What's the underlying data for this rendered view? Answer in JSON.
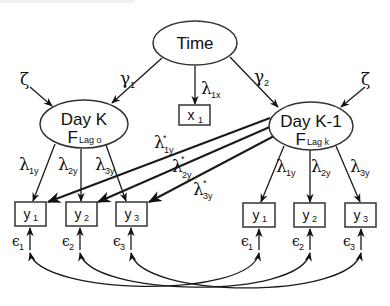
{
  "diagram": {
    "title": "",
    "latent": {
      "time": {
        "label": "Time"
      },
      "day_k": {
        "label": "Day K",
        "sub_main": "F",
        "sub_small": "Lag o"
      },
      "day_k1": {
        "label": "Day K-1",
        "sub_main": "F",
        "sub_small": "Lag k"
      }
    },
    "observed": {
      "x1": {
        "main": "x",
        "sub": "1"
      },
      "left": [
        {
          "main": "y",
          "sub": "1"
        },
        {
          "main": "y",
          "sub": "2"
        },
        {
          "main": "y",
          "sub": "3"
        }
      ],
      "right": [
        {
          "main": "y",
          "sub": "1"
        },
        {
          "main": "y",
          "sub": "2"
        },
        {
          "main": "y",
          "sub": "3"
        }
      ]
    },
    "paths": {
      "gamma1": {
        "sym": "γ",
        "sub": "1"
      },
      "gamma2": {
        "sym": "γ",
        "sub": "2"
      },
      "lambda_1x": {
        "sym": "λ",
        "sub": "1x"
      },
      "zeta_left": {
        "sym": "ζ"
      },
      "zeta_right": {
        "sym": "ζ"
      },
      "left_loadings": [
        {
          "sym": "λ",
          "sub": "1y"
        },
        {
          "sym": "λ",
          "sub": "2y"
        },
        {
          "sym": "λ",
          "sub": "3y"
        }
      ],
      "right_loadings": [
        {
          "sym": "λ",
          "sub": "1y"
        },
        {
          "sym": "λ",
          "sub": "2y"
        },
        {
          "sym": "λ",
          "sub": "3y"
        }
      ],
      "cross_loadings": [
        {
          "sym": "λ",
          "sup": "*",
          "sub": "1y"
        },
        {
          "sym": "λ",
          "sup": "*",
          "sub": "2y"
        },
        {
          "sym": "λ",
          "sup": "*",
          "sub": "3y"
        }
      ]
    },
    "errors": {
      "left": [
        {
          "sym": "ϵ",
          "sub": "1"
        },
        {
          "sym": "ϵ",
          "sub": "2"
        },
        {
          "sym": "ϵ",
          "sub": "3"
        }
      ],
      "right": [
        {
          "sym": "ϵ",
          "sub": "1"
        },
        {
          "sym": "ϵ",
          "sub": "2"
        },
        {
          "sym": "ϵ",
          "sub": "3"
        }
      ]
    },
    "colors": {
      "stroke": "#1a1a1a",
      "background": "#ffffff"
    }
  }
}
